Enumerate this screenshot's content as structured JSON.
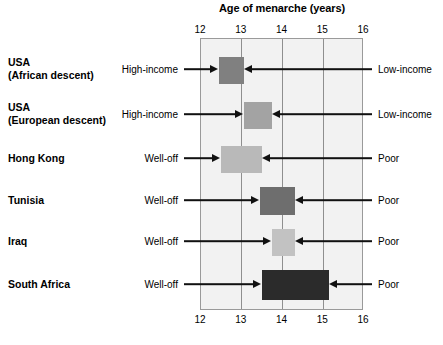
{
  "chart_data": {
    "type": "bar",
    "title": "Age of menarche (years)",
    "xlabel": "Age of menarche (years)",
    "ylabel": "",
    "xlim": [
      12,
      16
    ],
    "xticks": [
      12,
      13,
      14,
      15,
      16
    ],
    "xtick_labels": [
      "12",
      "13",
      "14",
      "15",
      "16"
    ],
    "tick_labels_top": [
      "12",
      "13",
      "14",
      "15",
      "16"
    ],
    "tick_labels_bottom": [
      "12",
      "13",
      "14",
      "15",
      "16"
    ],
    "grid": true,
    "grid_axis": "x",
    "legend": "none",
    "orientation": "horizontal",
    "bar_style": "range",
    "plot_background": "#f2f2f2",
    "frame_color": "#9a9a9a",
    "gridline_color": "#8f8f8f",
    "note": "Each bar is a range spanning the mean age of menarche from the more affluent subgroup (left end) to the poorer subgroup (right end).",
    "categories": [
      "USA (African descent)",
      "USA (European descent)",
      "Hong Kong",
      "Tunisia",
      "Iraq",
      "South Africa"
    ],
    "series": [
      {
        "name": "Affluent subgroup age (bar left edge)",
        "values": [
          12.45,
          13.05,
          12.5,
          13.45,
          13.75,
          13.5
        ]
      },
      {
        "name": "Poorer subgroup age (bar right edge)",
        "values": [
          13.05,
          13.75,
          13.5,
          14.3,
          14.3,
          15.15
        ]
      }
    ],
    "bars": [
      {
        "category": "USA (African descent)",
        "start": 12.45,
        "end": 13.05,
        "color": "#808080",
        "left_label": "High-income",
        "right_label": "Low-income"
      },
      {
        "category": "USA (European descent)",
        "start": 13.05,
        "end": 13.75,
        "color": "#a3a3a3",
        "left_label": "High-income",
        "right_label": "Low-income"
      },
      {
        "category": "Hong Kong",
        "start": 12.5,
        "end": 13.5,
        "color": "#b9b9b9",
        "left_label": "Well-off",
        "right_label": "Poor"
      },
      {
        "category": "Tunisia",
        "start": 13.45,
        "end": 14.3,
        "color": "#6e6e6e",
        "left_label": "Well-off",
        "right_label": "Poor"
      },
      {
        "category": "Iraq",
        "start": 13.75,
        "end": 14.3,
        "color": "#c2c2c2",
        "left_label": "Well-off",
        "right_label": "Poor"
      },
      {
        "category": "South Africa",
        "start": 13.5,
        "end": 15.15,
        "color": "#2b2b2b",
        "left_label": "Well-off",
        "right_label": "Poor"
      }
    ]
  },
  "rows": [
    {
      "label_line1": "USA",
      "label_line2": "(African descent)",
      "left_label": "High-income",
      "right_label": "Low-income"
    },
    {
      "label_line1": "USA",
      "label_line2": "(European descent)",
      "left_label": "High-income",
      "right_label": "Low-income"
    },
    {
      "label_line1": "Hong Kong",
      "label_line2": "",
      "left_label": "Well-off",
      "right_label": "Poor"
    },
    {
      "label_line1": "Tunisia",
      "label_line2": "",
      "left_label": "Well-off",
      "right_label": "Poor"
    },
    {
      "label_line1": "Iraq",
      "label_line2": "",
      "left_label": "Well-off",
      "right_label": "Poor"
    },
    {
      "label_line1": "South Africa",
      "label_line2": "",
      "left_label": "Well-off",
      "right_label": "Poor"
    }
  ]
}
